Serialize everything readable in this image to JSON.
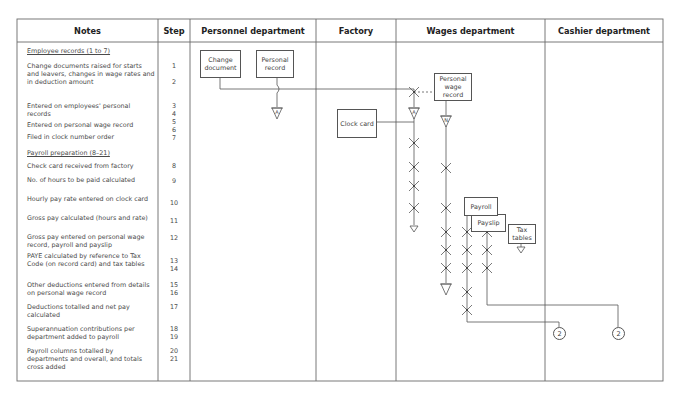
{
  "columns": [
    {
      "key": "notes",
      "label": "Notes"
    },
    {
      "key": "step",
      "label": "Step"
    },
    {
      "key": "personnel",
      "label": "Personnel department"
    },
    {
      "key": "factory",
      "label": "Factory"
    },
    {
      "key": "wages",
      "label": "Wages department"
    },
    {
      "key": "cashier",
      "label": "Cashier department"
    }
  ],
  "notes": [
    {
      "text": "Employee records (1 to 7)",
      "section": true
    },
    {
      "text": "Change documents raised for starts and leavers, changes in wage rates and in deduction amount"
    },
    {
      "text": "Entered on employees' personal records"
    },
    {
      "text": "Entered on personal wage record"
    },
    {
      "text": "Filed in clock number order"
    },
    {
      "text": "Payroll preparation (8–21)",
      "section": true
    },
    {
      "text": "Check card received from factory"
    },
    {
      "text": "No. of hours to be paid calculated"
    },
    {
      "text": "Hourly pay rate entered on clock card"
    },
    {
      "text": "Gross pay calculated (hours and rate)"
    },
    {
      "text": "Gross pay entered on personal wage record, payroll and payslip"
    },
    {
      "text": "PAYE calculated by reference to Tax Code (on record card) and tax tables"
    },
    {
      "text": "Other deductions entered from details on personal wage record"
    },
    {
      "text": "Deductions totalled and net pay calculated"
    },
    {
      "text": "Superannuation contributions per department added to payroll"
    },
    {
      "text": "Payroll columns totalled by departments and overall, and totals cross added"
    }
  ],
  "steps": [
    "1",
    "2",
    "3",
    "4",
    "5",
    "6",
    "7",
    "8",
    "9",
    "10",
    "11",
    "12",
    "13",
    "14",
    "15",
    "16",
    "17",
    "18",
    "19",
    "20",
    "21"
  ],
  "documents": {
    "change_document": "Change document",
    "personal_record": "Personal record",
    "clock_card": "Clock card",
    "personal_wage_record": "Personal wage record",
    "payroll": "Payroll",
    "payslip": "Payslip",
    "tax_tables": "Tax tables"
  },
  "connectors": {
    "file_a": "A",
    "file_n": "N",
    "cashier_link_1": "2",
    "cashier_link_2": "2"
  },
  "colors": {
    "line": "#555555",
    "grid": "#6a6a6a",
    "text": "#444444"
  }
}
